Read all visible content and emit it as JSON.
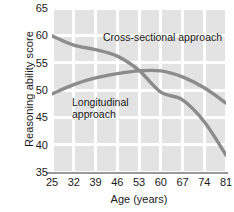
{
  "chart_data": {
    "type": "line",
    "title": "",
    "xlabel": "Age (years)",
    "ylabel": "Reasoning ability score",
    "xticks": [
      25,
      32,
      39,
      46,
      53,
      60,
      67,
      74,
      81
    ],
    "yticks": [
      35,
      40,
      45,
      50,
      55,
      60,
      65
    ],
    "xlim": [
      25,
      81
    ],
    "ylim": [
      35,
      65
    ],
    "grid": true,
    "legend_position": "inline-annotations",
    "x": [
      25,
      32,
      39,
      46,
      53,
      60,
      67,
      74,
      81
    ],
    "series": [
      {
        "name": "Cross-sectional approach",
        "label_text": "Cross-sectional approach",
        "color": "#8c8c8c",
        "values": [
          59.9,
          58.2,
          57.4,
          56.2,
          53.6,
          49.6,
          48.2,
          44.2,
          38.1
        ]
      },
      {
        "name": "Longitudinal approach",
        "label_text": "Longitudinal\napproach",
        "color": "#8c8c8c",
        "values": [
          49.3,
          51.0,
          52.2,
          53.0,
          53.5,
          53.5,
          52.4,
          50.4,
          47.6
        ]
      }
    ],
    "annotations": [
      {
        "text": "Cross-sectional approach",
        "at_x": 49,
        "at_y": 62
      },
      {
        "text": "Longitudinal\napproach",
        "at_x": 36,
        "at_y": 47.5
      }
    ],
    "colors": {
      "plot_background": "#e3e3e3",
      "gridline": "#ffffff",
      "axis_line": "#9a9a9a",
      "line": "#8c8c8c",
      "text": "#1a1a1a",
      "page_background": "#ffffff"
    }
  }
}
